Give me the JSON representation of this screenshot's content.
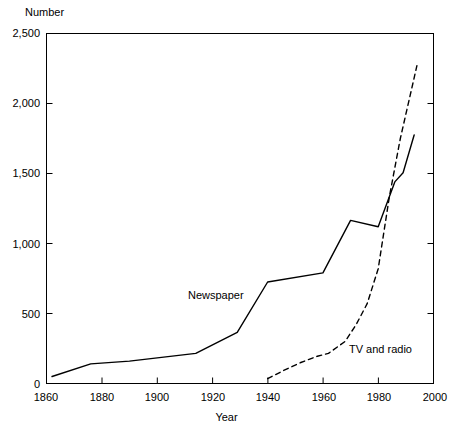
{
  "chart_data": {
    "type": "line",
    "title": "",
    "xlabel": "Year",
    "ylabel": "Number",
    "xlim": [
      1860,
      2000
    ],
    "ylim": [
      0,
      2500
    ],
    "grid": false,
    "legend_position": "inline-annotations",
    "xticks": [
      1860,
      1880,
      1900,
      1920,
      1940,
      1960,
      1980,
      2000
    ],
    "xtick_labels": [
      "1860",
      "1880",
      "1900",
      "1920",
      "1940",
      "1960",
      "1980",
      "2000"
    ],
    "yticks": [
      0,
      500,
      1000,
      1500,
      2000,
      2500
    ],
    "ytick_labels": [
      "0",
      "500",
      "1,000",
      "1,500",
      "2,000",
      "2,500"
    ],
    "series": [
      {
        "name": "Newspaper",
        "style": "solid",
        "color": "#000000",
        "x": [
          1862,
          1876,
          1890,
          1914,
          1929,
          1940,
          1960,
          1970,
          1980,
          1986,
          1989,
          1993
        ],
        "values": [
          50,
          140,
          160,
          215,
          365,
          725,
          790,
          1165,
          1120,
          1440,
          1505,
          1775
        ]
      },
      {
        "name": "TV and radio",
        "style": "dashed",
        "color": "#000000",
        "x": [
          1940,
          1946,
          1952,
          1958,
          1962,
          1968,
          1972,
          1976,
          1980,
          1984,
          1988,
          1994
        ],
        "values": [
          35,
          95,
          150,
          195,
          215,
          300,
          420,
          570,
          820,
          1330,
          1750,
          2270
        ]
      }
    ],
    "annotations": [
      {
        "text": "Newspaper",
        "x": 1918,
        "y": 640
      },
      {
        "text": "TV and radio",
        "x": 1978,
        "y": 300
      }
    ]
  }
}
